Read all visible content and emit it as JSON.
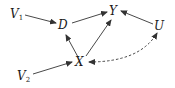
{
  "diagram": {
    "type": "causal-dag",
    "nodes": [
      {
        "id": "V1",
        "label": "V",
        "subscript": "1",
        "x": 16,
        "y": 17
      },
      {
        "id": "D",
        "label": "D",
        "subscript": "",
        "x": 63,
        "y": 29
      },
      {
        "id": "Y",
        "label": "Y",
        "subscript": "",
        "x": 114,
        "y": 15
      },
      {
        "id": "U",
        "label": "U",
        "subscript": "",
        "x": 159,
        "y": 30
      },
      {
        "id": "X",
        "label": "X",
        "subscript": "",
        "x": 80,
        "y": 65
      },
      {
        "id": "V2",
        "label": "V",
        "subscript": "2",
        "x": 23,
        "y": 80
      }
    ],
    "edges": [
      {
        "from": "V1",
        "to": "D",
        "style": "solid",
        "directed": "forward"
      },
      {
        "from": "D",
        "to": "Y",
        "style": "solid",
        "directed": "forward"
      },
      {
        "from": "U",
        "to": "Y",
        "style": "solid",
        "directed": "forward"
      },
      {
        "from": "X",
        "to": "D",
        "style": "solid",
        "directed": "forward"
      },
      {
        "from": "X",
        "to": "Y",
        "style": "solid",
        "directed": "forward"
      },
      {
        "from": "V2",
        "to": "X",
        "style": "solid",
        "directed": "forward"
      },
      {
        "from": "X",
        "to": "U",
        "style": "dashed",
        "directed": "bidirected"
      }
    ],
    "colors": {
      "line": "#333333",
      "text": "#1a1a1a",
      "background": "#ffffff"
    }
  }
}
